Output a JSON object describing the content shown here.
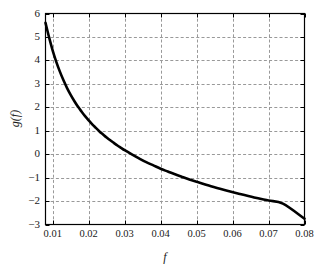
{
  "figure": {
    "background_color": "#ffffff",
    "axes_color": "#000000",
    "grid_color": "#999999",
    "curve_color": "#000000"
  },
  "chart_data": {
    "type": "line",
    "title": "",
    "subtitle": "",
    "xlabel": "f",
    "ylabel": "g(f)",
    "xlim": [
      0.008,
      0.08
    ],
    "ylim": [
      -3,
      6
    ],
    "grid": true,
    "grid_style": "dashed",
    "legend": null,
    "legend_position": "none",
    "xticks": [
      0.01,
      0.02,
      0.03,
      0.04,
      0.05,
      0.06,
      0.07,
      0.08
    ],
    "xtick_labels": [
      "0.01",
      "0.02",
      "0.03",
      "0.04",
      "0.05",
      "0.06",
      "0.07",
      "0.08"
    ],
    "yticks": [
      -3,
      -2,
      -1,
      0,
      1,
      2,
      3,
      4,
      5,
      6
    ],
    "ytick_labels": [
      "-3",
      "-2",
      "-1",
      "0",
      "1",
      "2",
      "3",
      "4",
      "5",
      "6"
    ],
    "series": [
      {
        "name": "g(f)",
        "color": "#000000",
        "line_width": 2.6,
        "x": [
          0.008,
          0.009,
          0.01,
          0.011,
          0.012,
          0.013,
          0.014,
          0.015,
          0.016,
          0.017,
          0.018,
          0.019,
          0.02,
          0.021,
          0.022,
          0.023,
          0.024,
          0.025,
          0.026,
          0.027,
          0.028,
          0.029,
          0.03,
          0.032,
          0.034,
          0.036,
          0.038,
          0.04,
          0.042,
          0.044,
          0.046,
          0.048,
          0.05,
          0.054,
          0.058,
          0.062,
          0.066,
          0.07,
          0.074,
          0.08
        ],
        "y": [
          5.6,
          4.98,
          4.42,
          3.94,
          3.52,
          3.15,
          2.82,
          2.53,
          2.27,
          2.03,
          1.82,
          1.62,
          1.44,
          1.27,
          1.12,
          0.97,
          0.84,
          0.71,
          0.59,
          0.48,
          0.37,
          0.27,
          0.17,
          -0.01,
          -0.18,
          -0.34,
          -0.48,
          -0.62,
          -0.74,
          -0.86,
          -0.97,
          -1.08,
          -1.18,
          -1.37,
          -1.54,
          -1.7,
          -1.85,
          -1.98,
          -2.11,
          -2.75
        ]
      }
    ]
  }
}
